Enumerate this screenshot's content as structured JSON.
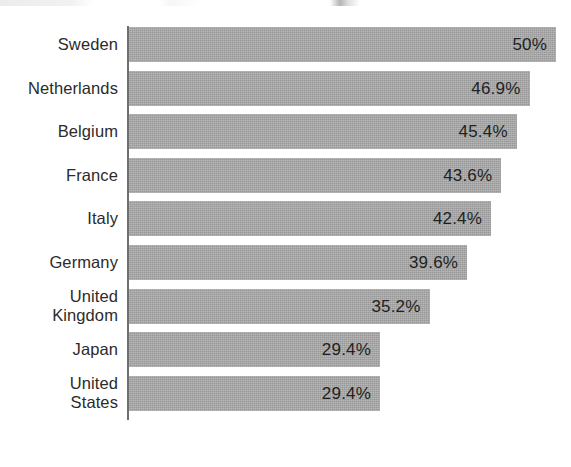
{
  "chart_data": {
    "type": "bar",
    "orientation": "horizontal",
    "title": "",
    "subtitle": "",
    "xlabel": "",
    "ylabel": "",
    "categories": [
      "Sweden",
      "Netherlands",
      "Belgium",
      "France",
      "Italy",
      "Germany",
      "United Kingdom",
      "Japan",
      "United States"
    ],
    "values": [
      50,
      46.9,
      45.4,
      43.6,
      42.4,
      39.6,
      35.2,
      29.4,
      29.4
    ],
    "value_labels": [
      "50%",
      "46.9%",
      "45.4%",
      "43.6%",
      "42.4%",
      "39.6%",
      "35.2%",
      "29.4%",
      "29.4%"
    ],
    "unit": "%",
    "xlim": [
      0,
      50
    ],
    "grid": false,
    "legend": null,
    "bar_color": "#a9a9a9",
    "axis_color": "#6e6e6e",
    "text_color": "#2b2b2b",
    "background": "#ffffff"
  },
  "bars": [
    {
      "label": "Sweden",
      "label_lines": [
        "Sweden"
      ],
      "value": 50,
      "value_label": "50%"
    },
    {
      "label": "Netherlands",
      "label_lines": [
        "Netherlands"
      ],
      "value": 46.9,
      "value_label": "46.9%"
    },
    {
      "label": "Belgium",
      "label_lines": [
        "Belgium"
      ],
      "value": 45.4,
      "value_label": "45.4%"
    },
    {
      "label": "France",
      "label_lines": [
        "France"
      ],
      "value": 43.6,
      "value_label": "43.6%"
    },
    {
      "label": "Italy",
      "label_lines": [
        "Italy"
      ],
      "value": 42.4,
      "value_label": "42.4%"
    },
    {
      "label": "Germany",
      "label_lines": [
        "Germany"
      ],
      "value": 39.6,
      "value_label": "39.6%"
    },
    {
      "label": "United Kingdom",
      "label_lines": [
        "United",
        "Kingdom"
      ],
      "value": 35.2,
      "value_label": "35.2%"
    },
    {
      "label": "Japan",
      "label_lines": [
        "Japan"
      ],
      "value": 29.4,
      "value_label": "29.4%"
    },
    {
      "label": "United States",
      "label_lines": [
        "United",
        "States"
      ],
      "value": 29.4,
      "value_label": "29.4%"
    }
  ],
  "layout": {
    "axis_x": 129,
    "first_bar_top": 27,
    "bar_height": 35,
    "bar_pitch": 43.6,
    "px_per_unit": 8.54
  }
}
